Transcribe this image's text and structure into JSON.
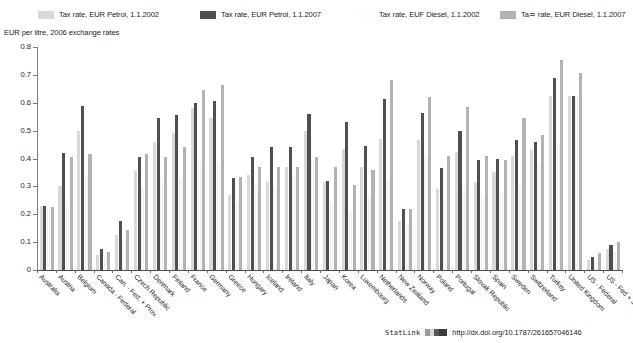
{
  "legend": {
    "entries": [
      {
        "label": "Tax rate, EUR Petrol, 1.1.2002",
        "color": "#d9d9d9",
        "icon": "legend-swatch"
      },
      {
        "label": "Tax rate, EUR Petrol, 1.1.2007",
        "color": "#4f4f4f",
        "icon": "legend-swatch"
      },
      {
        "label": "Tax rate, EUF Diesel, 1.1.2002",
        "color": "#ffffff",
        "icon": "legend-swatch"
      },
      {
        "label": "Ta≍ rate, EUR Diesel, 1.1.2007",
        "color": "#b3b3b3",
        "icon": "legend-swatch"
      }
    ]
  },
  "subtitle": "EUR per litre, 2006 exchange rates",
  "footer": {
    "statlink": "StatLink",
    "url": "http://dx.doi.org/10.1787/261657046146"
  },
  "chart_data": {
    "type": "bar",
    "title": "",
    "subtitle": "EUR per litre, 2006 exchange rates",
    "xlabel": "",
    "ylabel": "",
    "ylim": [
      0,
      0.8
    ],
    "yticks": [
      0,
      0.1,
      0.2,
      0.3,
      0.4,
      0.5,
      0.6,
      0.7,
      0.8
    ],
    "ytick_labels": [
      "0",
      "0.1",
      "0.2",
      "0.3",
      "0.4",
      "0.5",
      "0.6",
      "0.7",
      "0.8"
    ],
    "grid": false,
    "legend_position": "top",
    "categories": [
      "Australia",
      "Austria",
      "Belgium",
      "Canada - Federal",
      "Can. - Fed. + Prov.",
      "Czech Republic",
      "Denmark",
      "Finland",
      "France",
      "Germany",
      "Greece",
      "Hungary",
      "Iceland",
      "Ireland",
      "Italy",
      "Japan",
      "Korea",
      "Luxembourg",
      "Netherlands",
      "New Zealand",
      "Norway",
      "Poland",
      "Portugal",
      "Slovak Republic",
      "Spain",
      "Sweden",
      "Switzerland",
      "Turkey",
      "United Kingdom",
      "US - Federal",
      "US - Fed + State"
    ],
    "series": [
      {
        "name": "Tax rate, EUR Petrol, 1.1.2002",
        "color": "#d9d9d9",
        "values": [
          0.23,
          0.3,
          0.5,
          0.055,
          0.125,
          0.355,
          0.46,
          0.49,
          0.58,
          0.545,
          0.27,
          0.34,
          0.315,
          0.37,
          0.5,
          0.315,
          0.435,
          0.37,
          0.47,
          0.175,
          0.465,
          0.29,
          0.425,
          0.315,
          0.35,
          0.41,
          0.43,
          0.625,
          0.625,
          0.035,
          0.075
        ]
      },
      {
        "name": "Tax rate, EUR Petrol, 1.1.2007",
        "color": "#4f4f4f",
        "values": [
          0.23,
          0.42,
          0.59,
          0.075,
          0.175,
          0.405,
          0.545,
          0.555,
          0.6,
          0.605,
          0.33,
          0.405,
          0.44,
          0.44,
          0.56,
          0.32,
          0.53,
          0.445,
          0.615,
          0.22,
          0.565,
          0.365,
          0.5,
          0.395,
          0.4,
          0.465,
          0.46,
          0.69,
          0.625,
          0.045,
          0.09
        ]
      },
      {
        "name": "Tax rate, EUF Diesel, 1.1.2002",
        "color": "#ffffff",
        "values": [
          0.225,
          0.23,
          0.33,
          0.045,
          0.105,
          0.29,
          0.335,
          0.33,
          0.39,
          0.38,
          0.245,
          0.3,
          0.295,
          0.335,
          0.39,
          0.245,
          0.21,
          0.26,
          0.325,
          0.16,
          0.41,
          0.25,
          0.3,
          0.26,
          0.28,
          0.3,
          0.38,
          0.45,
          0.625,
          0.03,
          0.065
        ]
      },
      {
        "name": "Ta≍ rate, EUR Diesel, 1.1.2007",
        "color": "#b3b3b3",
        "values": [
          0.225,
          0.405,
          0.415,
          0.065,
          0.145,
          0.415,
          0.405,
          0.44,
          0.645,
          0.665,
          0.335,
          0.37,
          0.37,
          0.37,
          0.405,
          0.37,
          0.305,
          0.36,
          0.68,
          0.22,
          0.62,
          0.41,
          0.585,
          0.41,
          0.395,
          0.545,
          0.485,
          0.755,
          0.705,
          0.06,
          0.1
        ]
      }
    ],
    "value_pairs_note": "Each country displays two visible bar pairs: petrol (2002 light / 2007 dark) and diesel (2002 white / 2007 mid-grey)."
  }
}
